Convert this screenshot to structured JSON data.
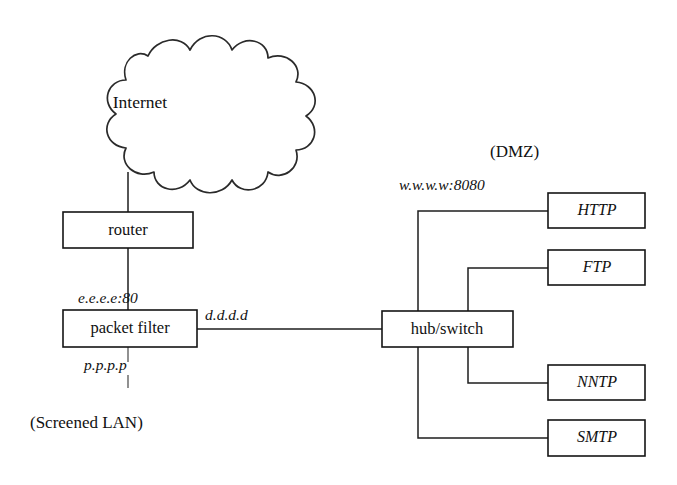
{
  "diagram": {
    "type": "network-topology",
    "title_visible": false,
    "background_color": "#ffffff",
    "line_color": "#1e1e1e",
    "text_color": "#111111",
    "cloud": {
      "label": "Internet",
      "shape": "starburst-cloud"
    },
    "nodes": [
      {
        "id": "router",
        "label": "router",
        "style": "upright",
        "x": 63,
        "y": 212,
        "w": 130,
        "h": 36
      },
      {
        "id": "packetfilter",
        "label": "packet filter",
        "style": "upright",
        "x": 63,
        "y": 310,
        "w": 134,
        "h": 37
      },
      {
        "id": "hubswitch",
        "label": "hub/switch",
        "style": "upright",
        "x": 382,
        "y": 311,
        "w": 131,
        "h": 36
      },
      {
        "id": "http",
        "label": "HTTP",
        "style": "italic",
        "x": 548,
        "y": 193,
        "w": 97,
        "h": 35
      },
      {
        "id": "ftp",
        "label": "FTP",
        "style": "italic",
        "x": 548,
        "y": 250,
        "w": 97,
        "h": 35
      },
      {
        "id": "nntp",
        "label": "NNTP",
        "style": "italic",
        "x": 548,
        "y": 365,
        "w": 97,
        "h": 35
      },
      {
        "id": "smtp",
        "label": "SMTP",
        "style": "italic",
        "x": 548,
        "y": 420,
        "w": 97,
        "h": 36
      }
    ],
    "edge_labels": [
      {
        "id": "label-e",
        "text": "e.e.e.e:80",
        "x": 78,
        "y": 303
      },
      {
        "id": "label-p",
        "text": "p.p.p.p",
        "x": 84,
        "y": 370
      },
      {
        "id": "label-d",
        "text": "d.d.d.d",
        "x": 205,
        "y": 320
      },
      {
        "id": "label-www",
        "text": "w.w.w.w:8080",
        "x": 399,
        "y": 190
      }
    ],
    "zone_labels": [
      {
        "id": "zone-dmz",
        "text": "(DMZ)",
        "x": 490,
        "y": 157
      },
      {
        "id": "zone-screened-lan",
        "text": "(Screened LAN)",
        "x": 30,
        "y": 428
      }
    ],
    "connections": [
      {
        "id": "internet-router",
        "from": "Internet",
        "to": "router"
      },
      {
        "id": "router-packetfilter",
        "from": "router",
        "to": "packet filter"
      },
      {
        "id": "packetfilter-stub",
        "from": "packet filter",
        "to": "Screened LAN"
      },
      {
        "id": "packetfilter-hub",
        "from": "packet filter",
        "to": "hub/switch"
      },
      {
        "id": "hub-http",
        "from": "hub/switch",
        "to": "HTTP"
      },
      {
        "id": "hub-ftp",
        "from": "hub/switch",
        "to": "FTP"
      },
      {
        "id": "hub-nntp",
        "from": "hub/switch",
        "to": "NNTP"
      },
      {
        "id": "hub-smtp",
        "from": "hub/switch",
        "to": "SMTP"
      }
    ]
  }
}
